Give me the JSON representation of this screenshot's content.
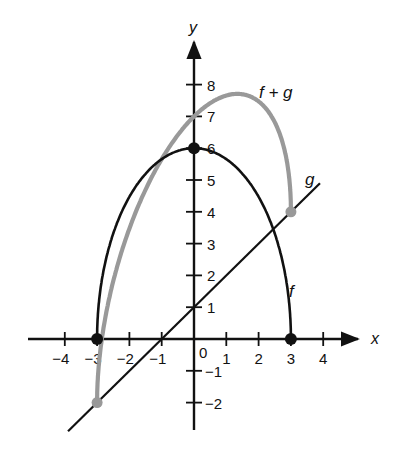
{
  "chart_data": {
    "type": "line",
    "title": "",
    "xlabel": "x",
    "ylabel": "y",
    "xlim": [
      -4.2,
      4.7
    ],
    "ylim": [
      -2.9,
      8.9
    ],
    "grid": false,
    "x_ticks": [
      -4,
      -3,
      -2,
      -1,
      1,
      2,
      3,
      4
    ],
    "x_tick_labels": [
      "−4",
      "−3",
      "−2",
      "−1",
      "1",
      "2",
      "3",
      "4"
    ],
    "y_ticks": [
      -2,
      -1,
      1,
      2,
      3,
      4,
      5,
      6,
      7,
      8
    ],
    "y_tick_labels": [
      "−2",
      "−1",
      "1",
      "2",
      "3",
      "4",
      "5",
      "6",
      "7",
      "8"
    ],
    "origin_label": "0",
    "series": [
      {
        "name": "f",
        "color": "#111111",
        "formula": "f(x) = 2*sqrt(9 - x^2)",
        "x": [
          -3,
          -2.5,
          -2,
          -1.5,
          -1,
          -0.5,
          0,
          0.5,
          1,
          1.5,
          2,
          2.5,
          3
        ],
        "values": [
          0,
          3.32,
          4.47,
          5.2,
          5.66,
          5.92,
          6,
          5.92,
          5.66,
          5.2,
          4.47,
          3.32,
          0
        ],
        "endpoints": [
          [
            -3,
            0
          ],
          [
            0,
            6
          ],
          [
            3,
            0
          ]
        ]
      },
      {
        "name": "g",
        "color": "#111111",
        "formula": "g(x) = x + 1",
        "x": [
          -3.9,
          3.9
        ],
        "values": [
          -2.9,
          4.9
        ]
      },
      {
        "name": "f + g",
        "color": "#999999",
        "formula": "(f+g)(x) = 2*sqrt(9 - x^2) + x + 1",
        "x": [
          -3,
          -2.5,
          -2,
          -1.5,
          -1,
          -0.5,
          0,
          0.5,
          1,
          1.5,
          2,
          2.5,
          3
        ],
        "values": [
          -2,
          1.82,
          3.47,
          4.7,
          5.66,
          6.42,
          7,
          7.42,
          7.66,
          7.7,
          7.47,
          6.82,
          4
        ],
        "endpoints": [
          [
            -3,
            -2
          ],
          [
            3,
            4
          ]
        ]
      }
    ],
    "annotations": [
      {
        "text": "f + g",
        "near": [
          2.3,
          8
        ]
      },
      {
        "text": "g",
        "near": [
          3.7,
          5
        ]
      },
      {
        "text": "f",
        "near": [
          3,
          1.4
        ]
      }
    ]
  },
  "labels": {
    "x_axis": "x",
    "y_axis": "y",
    "origin": "0",
    "fg": "f + g",
    "g": "g",
    "f": "f"
  }
}
